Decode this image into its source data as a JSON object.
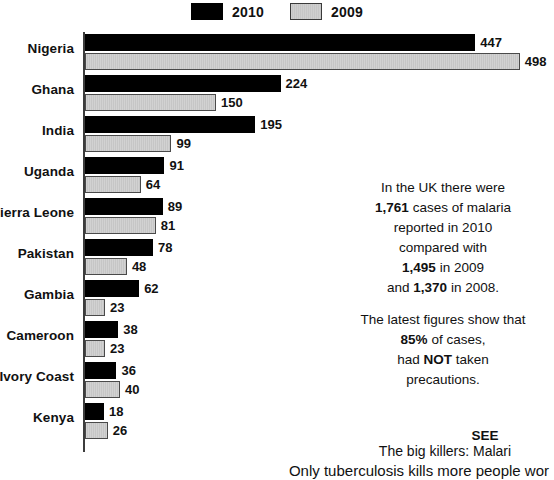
{
  "legend": {
    "entries": [
      {
        "label": "2010",
        "swatch": "black-swatch",
        "color": "#000000"
      },
      {
        "label": "2009",
        "swatch": "gray-swatch",
        "color": "#cdcdcd"
      }
    ]
  },
  "chart_data": {
    "type": "bar",
    "orientation": "horizontal",
    "title": "",
    "xlabel": "",
    "ylabel": "",
    "grid": false,
    "legend_position": "top-center",
    "xlim": [
      0,
      498
    ],
    "categories": [
      "Nigeria",
      "Ghana",
      "India",
      "Uganda",
      "Sierra Leone",
      "Pakistan",
      "Gambia",
      "Cameroon",
      "Ivory Coast",
      "Kenya"
    ],
    "series": [
      {
        "name": "2010",
        "color": "#000000",
        "values": [
          447,
          224,
          195,
          91,
          89,
          78,
          62,
          38,
          36,
          18
        ]
      },
      {
        "name": "2009",
        "color": "#cdcdcd",
        "values": [
          498,
          150,
          99,
          64,
          81,
          48,
          23,
          23,
          40,
          26
        ]
      }
    ]
  },
  "side_note": {
    "line1": "In the UK there were",
    "line2_bold": "1,761",
    "line2_rest": " cases of malaria",
    "line3": "reported in 2010",
    "line4": "compared with",
    "line5_bold": "1,495",
    "line5_rest": " in 2009",
    "line6_pre": "and ",
    "line6_bold": "1,370",
    "line6_rest": " in 2008."
  },
  "note_block_2": {
    "line1": "The latest figures show that",
    "line2_bold": "85%",
    "line2_rest": " of cases,",
    "line3_pre": "had ",
    "line3_bold": "NOT",
    "line3_rest": " taken",
    "line4": "precautions."
  },
  "footer": {
    "see_also": "SEE",
    "headline": "The big killers: Malari",
    "body": "Only tuberculosis kills more people wor"
  }
}
